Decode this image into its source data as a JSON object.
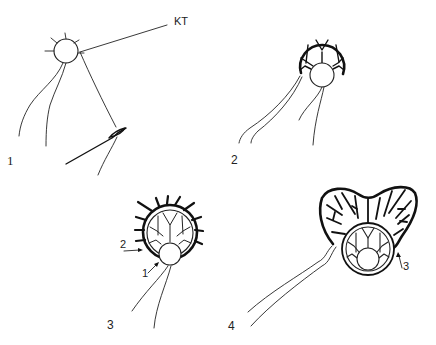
{
  "figure": {
    "background": "#ffffff",
    "ink_color": "#111111",
    "panels": [
      {
        "id": 1,
        "label": "1",
        "annotations": [
          {
            "text": "KT"
          }
        ]
      },
      {
        "id": 2,
        "label": "2",
        "annotations": []
      },
      {
        "id": 3,
        "label": "3",
        "annotations": [
          {
            "text": "2"
          },
          {
            "text": "1"
          }
        ]
      },
      {
        "id": 4,
        "label": "4",
        "annotations": [
          {
            "text": "3"
          }
        ]
      }
    ]
  }
}
